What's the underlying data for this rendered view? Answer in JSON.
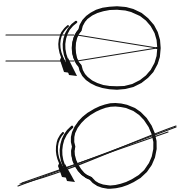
{
  "figure": {
    "background_color": "#ffffff",
    "ink_color": "#111111",
    "width": 179,
    "height": 193,
    "panel_count": 2
  },
  "panels": [
    {
      "id": "panel-top",
      "name": "normal-focus-eye",
      "description": "Upright eyeball with two parallel horizontal light rays entering the cornea and converging to a single focal point on the retina at the back of the eye.",
      "eye_orientation_degrees": 0,
      "ray_count": 2,
      "ray_type": "parallel-horizontal",
      "focus_state": "focused-on-retina",
      "rotation_arrow": {
        "name": "cornea-rotation-arrow",
        "direction": "downward-curved",
        "position": "anterior-cornea"
      },
      "geometry": {
        "eye_center_x": 117,
        "eye_center_y": 48,
        "eye_radius_x": 42,
        "eye_radius_y": 40,
        "cornea_apex_x": 72,
        "focal_point_x": 157,
        "focal_point_y": 48,
        "ray_upper_y": 35,
        "ray_lower_y": 61,
        "ray_start_x": 6
      }
    },
    {
      "id": "panel-bottom",
      "name": "tilted-defocus-eye",
      "description": "Same eyeball rotated clockwise about thirty degrees; the light rays now pass obliquely through the globe and cross outside it at the upper right, missing the retina.",
      "eye_orientation_degrees": -28,
      "ray_count": 2,
      "ray_type": "oblique-converging",
      "focus_state": "defocused-crossing-behind-retina",
      "rotation_arrow": {
        "name": "cornea-rotation-arrow",
        "direction": "downward-curved",
        "position": "anterior-cornea"
      },
      "geometry": {
        "eye_center_x": 113,
        "eye_center_y": 146,
        "eye_radius_x": 41,
        "eye_radius_y": 40,
        "ray_start_x": 18,
        "ray_start_y": 186,
        "ray_end_x": 176,
        "ray_end_y": 127
      }
    }
  ],
  "labels": {
    "has_text_labels": false,
    "caption": ""
  }
}
